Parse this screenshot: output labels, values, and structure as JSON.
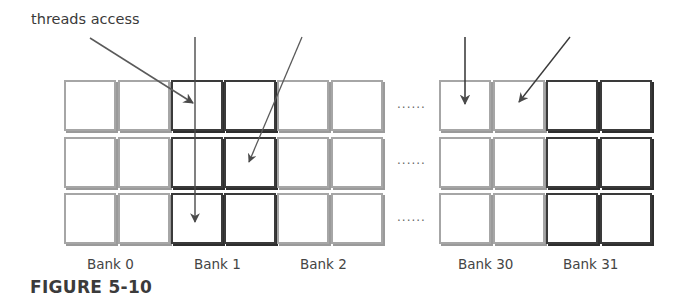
{
  "annotation": {
    "text": "threads access"
  },
  "caption": {
    "text": "FIGURE 5-10"
  },
  "ellipsis": "......",
  "banks": [
    {
      "label": "Bank 0",
      "style": "light"
    },
    {
      "label": "Bank 1",
      "style": "dark"
    },
    {
      "label": "Bank 2",
      "style": "light"
    },
    {
      "label": "Bank 30",
      "style": "light"
    },
    {
      "label": "Bank 31",
      "style": "dark"
    }
  ],
  "grid": {
    "rows": 3,
    "cells_per_bank": 2
  },
  "arrows": [
    {
      "name": "arrow-to-bank1-row1",
      "target": "Bank 1, row 1"
    },
    {
      "name": "arrow-to-bank1-row3",
      "target": "Bank 1, row 3"
    },
    {
      "name": "arrow-to-bank1-row2",
      "target": "Bank 1, row 2"
    },
    {
      "name": "arrow-to-bank30-row1-a",
      "target": "Bank 30, row 1"
    },
    {
      "name": "arrow-to-bank30-row1-b",
      "target": "Bank 30, row 1"
    }
  ],
  "colors": {
    "light_cell": "#a6a6a6",
    "dark_cell": "#3a3a3a",
    "arrow": "#4a4a4a"
  }
}
